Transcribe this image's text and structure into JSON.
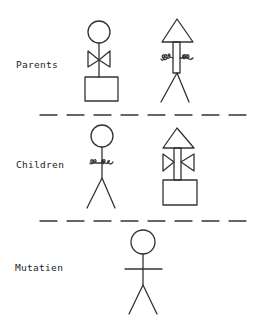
{
  "diagram": {
    "sections": [
      {
        "id": "parents",
        "label": "Parents"
      },
      {
        "id": "children",
        "label": "Children"
      },
      {
        "id": "mutation",
        "label": "Mutatien"
      }
    ],
    "figures": {
      "parent_1": {
        "head": "circle",
        "arms": "bowtie",
        "lower": "box"
      },
      "parent_2": {
        "head": "triangle",
        "arms": "wiggle",
        "lower": "legs"
      },
      "child_1": {
        "head": "circle",
        "arms": "wiggle",
        "lower": "legs"
      },
      "child_2": {
        "head": "triangle",
        "arms": "bowtie",
        "lower": "box"
      },
      "mutation_1": {
        "head": "circle",
        "arms": "straight",
        "lower": "legs"
      }
    },
    "colors": {
      "stroke": "#333333",
      "background": "#ffffff"
    }
  }
}
